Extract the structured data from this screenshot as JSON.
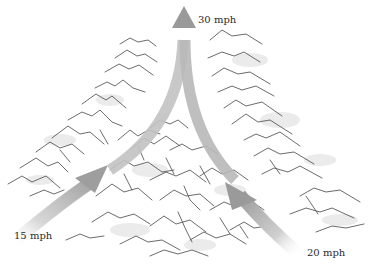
{
  "figure": {
    "winds": [
      {
        "id": "left-inflow",
        "speed_label": "15 mph",
        "speed": 15,
        "unit": "mph",
        "direction": "inflow"
      },
      {
        "id": "right-inflow",
        "speed_label": "20 mph",
        "speed": 20,
        "unit": "mph",
        "direction": "inflow"
      },
      {
        "id": "outflow",
        "speed_label": "30 mph",
        "speed": 30,
        "unit": "mph",
        "direction": "outflow"
      }
    ],
    "colors": {
      "arrow": "#a8a8a8",
      "arrow_light": "#dcdcdc",
      "mountain_line": "#555555",
      "mountain_shade": "#e6e6e6",
      "background": "#ffffff"
    }
  }
}
